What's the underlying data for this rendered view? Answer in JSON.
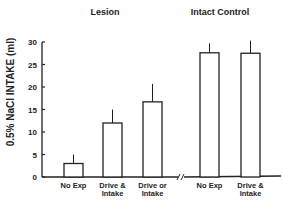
{
  "chart_data": {
    "type": "bar",
    "title": "",
    "xlabel": "",
    "ylabel": "0.5% NaCl INTAKE (ml)",
    "ylim": [
      0,
      30
    ],
    "yticks": [
      0,
      5,
      10,
      15,
      20,
      25,
      30
    ],
    "grid": false,
    "groups": [
      {
        "name": "Lesion",
        "categories": [
          {
            "label": [
              "No Exp"
            ],
            "value": 3,
            "error_upper": 5
          },
          {
            "label": [
              "Drive &",
              "Intake"
            ],
            "value": 12,
            "error_upper": 15
          },
          {
            "label": [
              "Drive or",
              "Intake"
            ],
            "value": 16.7,
            "error_upper": 20.7
          }
        ]
      },
      {
        "name": "Intact Control",
        "categories": [
          {
            "label": [
              "No Exp"
            ],
            "value": 27.6,
            "error_upper": 29.7
          },
          {
            "label": [
              "Drive &",
              "Intake"
            ],
            "value": 27.5,
            "error_upper": 30.3
          }
        ]
      }
    ],
    "axis_break": true
  }
}
